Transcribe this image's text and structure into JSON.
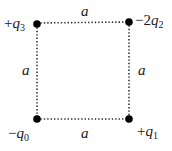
{
  "diagram": {
    "type": "square charge configuration",
    "side_label": "a",
    "colors": {
      "line": "#333333",
      "dot": "#000000",
      "text": "#1a1a1a"
    },
    "corners": [
      {
        "position": "top-left",
        "sign": "+",
        "coef": "",
        "symbol": "q",
        "subscript": "3",
        "x": 37,
        "y": 24
      },
      {
        "position": "top-right",
        "sign": "−",
        "coef": "2",
        "symbol": "q",
        "subscript": "2",
        "x": 129,
        "y": 22
      },
      {
        "position": "bottom-left",
        "sign": "−",
        "coef": "",
        "symbol": "q",
        "subscript": "0",
        "x": 37,
        "y": 119
      },
      {
        "position": "bottom-right",
        "sign": "+",
        "coef": "",
        "symbol": "q",
        "subscript": "1",
        "x": 129,
        "y": 119
      }
    ],
    "edges": [
      {
        "position": "top",
        "label": "a"
      },
      {
        "position": "right",
        "label": "a"
      },
      {
        "position": "bottom",
        "label": "a"
      },
      {
        "position": "left",
        "label": "a"
      }
    ]
  }
}
